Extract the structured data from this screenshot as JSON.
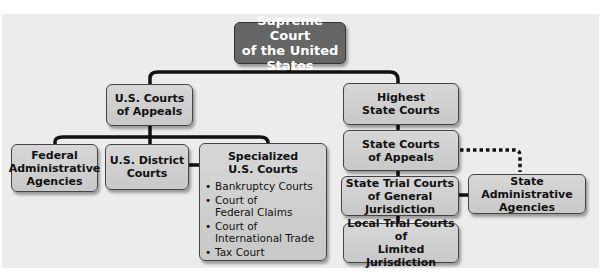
{
  "diagram": {
    "title_node": "Supreme Court of the United States",
    "nodes": {
      "supreme": [
        "Supreme Court",
        "of the United States"
      ],
      "us_appeals": [
        "U.S. Courts",
        "of Appeals"
      ],
      "federal_admin": [
        "Federal",
        "Administrative",
        "Agencies"
      ],
      "us_district": [
        "U.S. District",
        "Courts"
      ],
      "specialized": {
        "title": [
          "Specialized",
          "U.S. Courts"
        ],
        "items": [
          "Bankruptcy Courts",
          "Court of Federal Claims",
          "Court of International Trade",
          "Tax Court"
        ]
      },
      "highest_state": [
        "Highest",
        "State Courts"
      ],
      "state_appeals": [
        "State Courts",
        "of Appeals"
      ],
      "state_trial": [
        "State Trial Courts",
        "of General Jurisdiction"
      ],
      "state_admin": [
        "State Administrative",
        "Agencies"
      ],
      "local_trial": [
        "Local Trial Courts of",
        "Limited Jurisdiction"
      ]
    },
    "colors": {
      "top_node": "#666666",
      "node": "#d0d0d0",
      "connector": "#111111",
      "panel": "#ececec"
    }
  }
}
